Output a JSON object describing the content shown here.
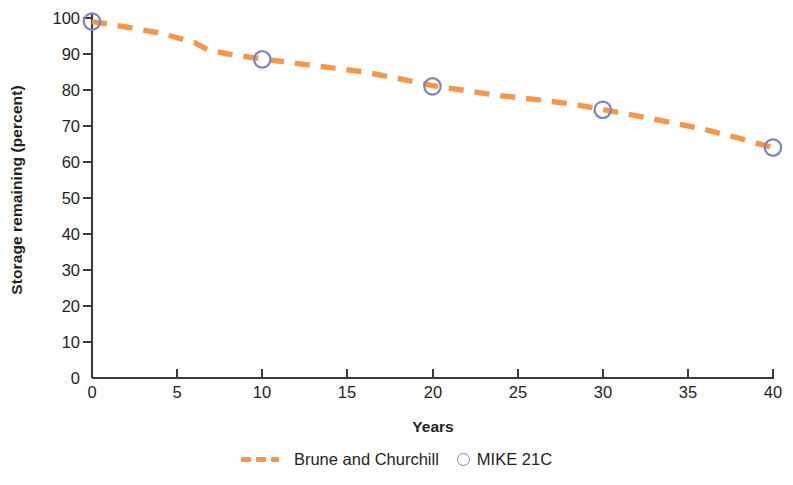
{
  "chart_data": {
    "type": "line",
    "title": "",
    "xlabel": "Years",
    "ylabel": "Storage remaining (percent)",
    "xlim": [
      0,
      40
    ],
    "ylim": [
      0,
      100
    ],
    "xticks": [
      0,
      5,
      10,
      15,
      20,
      25,
      30,
      35,
      40
    ],
    "ytricks_note": "",
    "yticks": [
      0,
      10,
      20,
      30,
      40,
      50,
      60,
      70,
      80,
      90,
      100
    ],
    "grid": false,
    "legend_position": "below",
    "series": [
      {
        "name": "Brune and Churchill",
        "style": "dashed-line",
        "color": "#f5964a",
        "x": [
          0,
          2,
          4,
          6,
          6.8,
          8,
          10,
          12,
          14,
          16,
          18,
          20,
          22,
          24,
          26,
          28,
          30,
          32,
          34,
          36,
          38,
          40
        ],
        "values": [
          99,
          97.5,
          95.8,
          93.2,
          91.2,
          90.0,
          88.6,
          87.4,
          86.2,
          85.0,
          83.2,
          81.2,
          79.8,
          78.4,
          77.4,
          76.2,
          74.6,
          72.8,
          71.0,
          69.0,
          66.6,
          64.0
        ]
      },
      {
        "name": "MIKE 21C",
        "style": "open-circle-markers",
        "color": "#7b86bf",
        "x": [
          0,
          10,
          20,
          30,
          40
        ],
        "values": [
          99,
          88.5,
          81,
          74.5,
          64
        ]
      }
    ]
  },
  "axes": {
    "y_tick_labels": [
      "100",
      "90",
      "80",
      "70",
      "60",
      "50",
      "40",
      "30",
      "20",
      "10",
      "0"
    ],
    "x_tick_labels": [
      "0",
      "5",
      "10",
      "15",
      "20",
      "25",
      "30",
      "35",
      "40"
    ]
  },
  "legend": {
    "entries": [
      {
        "label": "Brune and Churchill",
        "marker": "dashed-line-swatch"
      },
      {
        "label": "MIKE 21C",
        "marker": "open-circle-swatch"
      }
    ]
  },
  "colors": {
    "line_orange": "#f5964a",
    "marker_blue": "#7b86bf",
    "axis_black": "#3a3a3a",
    "text": "#231f20"
  }
}
